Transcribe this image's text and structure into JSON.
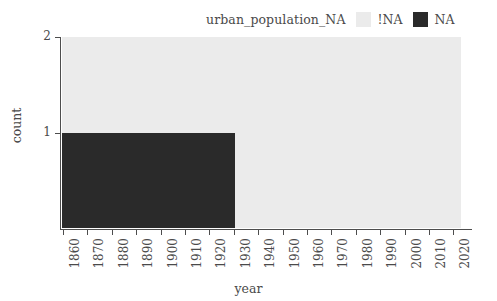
{
  "legend": {
    "title": "urban_population_NA",
    "entries": [
      {
        "label": "!NA",
        "color": "#ebebeb"
      },
      {
        "label": "NA",
        "color": "#2a2a2a"
      }
    ]
  },
  "axes": {
    "x_title": "year",
    "y_title": "count"
  },
  "chart_data": {
    "type": "bar",
    "title": "",
    "subtitle": "",
    "xlabel": "year",
    "ylabel": "count",
    "stacked": true,
    "grid": false,
    "legend_position": "top-right",
    "legend_title": "urban_population_NA",
    "xlim": [
      1855,
      2020
    ],
    "ylim": [
      0,
      2
    ],
    "x_ticks": [
      1860,
      1870,
      1880,
      1890,
      1900,
      1910,
      1920,
      1930,
      1940,
      1950,
      1960,
      1970,
      1980,
      1990,
      2000,
      2010,
      2020
    ],
    "y_ticks": [
      1,
      2
    ],
    "bin_width": 10,
    "bins": [
      1860,
      1870,
      1880,
      1890,
      1900,
      1910,
      1920,
      1930,
      1940,
      1950,
      1960,
      1970,
      1980,
      1990,
      2000,
      2010
    ],
    "series": [
      {
        "name": "NA",
        "color": "#2a2a2a",
        "values": [
          1,
          1,
          1,
          1,
          1,
          1,
          1,
          0,
          0,
          0,
          0,
          0,
          0,
          0,
          0,
          0
        ]
      },
      {
        "name": "!NA",
        "color": "#ebebeb",
        "values": [
          1,
          1,
          1,
          1,
          1,
          1,
          1,
          2,
          2,
          2,
          2,
          2,
          2,
          2,
          2,
          2
        ]
      }
    ]
  }
}
